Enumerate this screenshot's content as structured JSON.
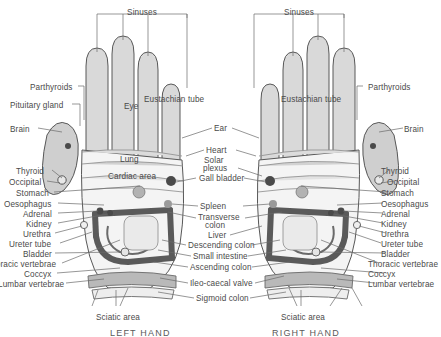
{
  "figure": {
    "type": "reflexology-hand-chart",
    "background": "#ffffff",
    "ink": "#4a4a4a",
    "hand_fill": "#d9d9d9",
    "palm_fill": "#f2f2f2",
    "band_fill": "#c9c9c9",
    "colon_color": "#5a5a5a",
    "dot_color": "#5a5a5a"
  },
  "captions": {
    "left_hand": "LEFT HAND",
    "right_hand": "RIGHT HAND"
  },
  "brackets": {
    "sinuses_left": "Sinuses",
    "sinuses_right": "Sinuses"
  },
  "labels_left_outer": [
    {
      "text": "Parthyroids",
      "x": 30,
      "y": 84
    },
    {
      "text": "Pituitary gland",
      "x": 10,
      "y": 102
    },
    {
      "text": "Brain",
      "x": 10,
      "y": 126
    },
    {
      "text": "Thyroid",
      "x": 16,
      "y": 168
    },
    {
      "text": "Occipital",
      "x": 9,
      "y": 179
    },
    {
      "text": "Stomach",
      "x": 16,
      "y": 190
    },
    {
      "text": "Oesophagus",
      "x": 4,
      "y": 201
    },
    {
      "text": "Adrenal",
      "x": 23,
      "y": 211
    },
    {
      "text": "Kidney",
      "x": 26,
      "y": 221
    },
    {
      "text": "Urethra",
      "x": 23,
      "y": 231
    },
    {
      "text": "Ureter tube",
      "x": 9,
      "y": 241
    },
    {
      "text": "Bladder",
      "x": 23,
      "y": 251
    },
    {
      "text": "Thoracic vertebrae",
      "x": -14,
      "y": 261
    },
    {
      "text": "Coccyx",
      "x": 24,
      "y": 271
    },
    {
      "text": "Lumbar vertebrae",
      "x": -2,
      "y": 281
    }
  ],
  "labels_right_outer": [
    {
      "text": "Parthyroids",
      "x": 368,
      "y": 84
    },
    {
      "text": "Brain",
      "x": 404,
      "y": 126
    },
    {
      "text": "Thyroid",
      "x": 381,
      "y": 168
    },
    {
      "text": "Occipital",
      "x": 387,
      "y": 179
    },
    {
      "text": "Stomach",
      "x": 381,
      "y": 190
    },
    {
      "text": "Oesophagus",
      "x": 381,
      "y": 201
    },
    {
      "text": "Adrenal",
      "x": 381,
      "y": 211
    },
    {
      "text": "Kidney",
      "x": 381,
      "y": 221
    },
    {
      "text": "Urethra",
      "x": 381,
      "y": 231
    },
    {
      "text": "Ureter tube",
      "x": 381,
      "y": 241
    },
    {
      "text": "Bladder",
      "x": 381,
      "y": 251
    },
    {
      "text": "Thoracic vertebrae",
      "x": 368,
      "y": 261
    },
    {
      "text": "Coccyx",
      "x": 368,
      "y": 271
    },
    {
      "text": "Lumbar vertebrae",
      "x": 368,
      "y": 281
    }
  ],
  "labels_center": [
    {
      "text": "Ear",
      "x": 214,
      "y": 125
    },
    {
      "text": "Heart",
      "x": 206,
      "y": 147
    },
    {
      "text": "Solar",
      "x": 204,
      "y": 157
    },
    {
      "text": "plexus",
      "x": 203,
      "y": 165
    },
    {
      "text": "Gall bladder",
      "x": 199,
      "y": 175
    },
    {
      "text": "Spleen",
      "x": 200,
      "y": 203
    },
    {
      "text": "Transverse",
      "x": 198,
      "y": 214
    },
    {
      "text": "colon",
      "x": 205,
      "y": 222
    },
    {
      "text": "Liver",
      "x": 208,
      "y": 232
    },
    {
      "text": "Descending colon",
      "x": 188,
      "y": 242
    },
    {
      "text": "Small intestine",
      "x": 193,
      "y": 253
    },
    {
      "text": "Ascending colon",
      "x": 190,
      "y": 264
    },
    {
      "text": "Ileo-caecal valve",
      "x": 190,
      "y": 280
    },
    {
      "text": "Sigmoid colon",
      "x": 196,
      "y": 295
    }
  ],
  "labels_on_left_hand": [
    {
      "text": "Eye",
      "x": 124,
      "y": 103
    },
    {
      "text": "Eustachian tube",
      "x": 144,
      "y": 96
    },
    {
      "text": "Lung",
      "x": 120,
      "y": 156
    },
    {
      "text": "Cardiac area",
      "x": 108,
      "y": 173
    }
  ],
  "labels_on_right_hand": [
    {
      "text": "Eustachian tube",
      "x": 281,
      "y": 96
    }
  ],
  "labels_bottom": [
    {
      "text": "Sciatic area",
      "x": 96,
      "y": 314
    },
    {
      "text": "Sciatic area",
      "x": 281,
      "y": 314
    }
  ]
}
